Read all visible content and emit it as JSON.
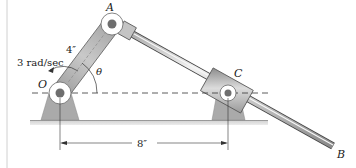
{
  "figure": {
    "type": "mechanism-diagram",
    "labels": {
      "point_A": "A",
      "point_B": "B",
      "point_C": "C",
      "point_O": "O",
      "angle": "θ",
      "crank_length": "4″",
      "angular_velocity": "3 rad/sec",
      "pivot_distance": "8″"
    },
    "colors": {
      "link": "#b5b5b5",
      "link_dark": "#8d8d8d",
      "rod": "#c8c8c8",
      "rod_edge": "#555555",
      "support": "#a9a9a9",
      "ground": "#c9c9c9",
      "pin_hub": "#ffffff",
      "pin_center": "#6e6e6e",
      "line": "#333333",
      "border": "#d0d0d0"
    }
  }
}
